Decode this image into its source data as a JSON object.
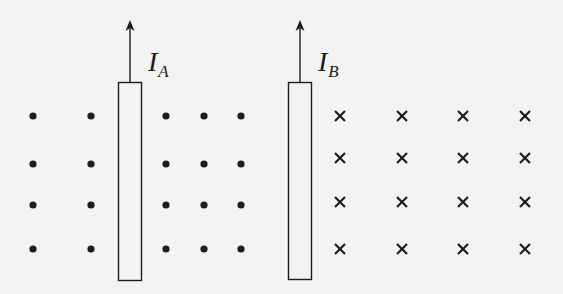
{
  "diagram": {
    "colors": {
      "background": "#f3f3f1",
      "stroke": "#1c1c1c"
    },
    "conductors": [
      {
        "id": "A",
        "label_main": "I",
        "label_sub": "A",
        "current_direction": "up",
        "rect": {
          "x": 118,
          "y": 82,
          "w": 23,
          "h": 198
        },
        "arrow_top_y": 20
      },
      {
        "id": "B",
        "label_main": "I",
        "label_sub": "B",
        "current_direction": "up",
        "rect": {
          "x": 288,
          "y": 82,
          "w": 23,
          "h": 197
        },
        "arrow_top_y": 20
      }
    ],
    "field_dots": {
      "meaning": "out of page",
      "symbol": "•",
      "columns": [
        33,
        91,
        166,
        204,
        241
      ],
      "rows": [
        116,
        164,
        205,
        249
      ]
    },
    "field_crosses": {
      "meaning": "into page",
      "symbol": "x",
      "columns": [
        340,
        402,
        463,
        525
      ],
      "rows": [
        116,
        158,
        202,
        249
      ]
    }
  }
}
